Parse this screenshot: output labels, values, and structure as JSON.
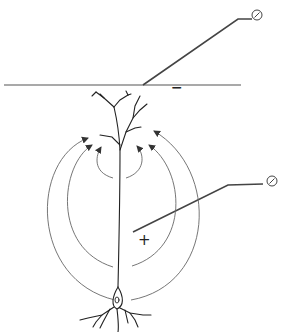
{
  "diagram": {
    "type": "neuron extracellular field diagram",
    "labels": {
      "surface_polarity": "−",
      "depth_polarity": "+"
    },
    "elements": {
      "surface_line": "cortical surface",
      "surface_electrode": "gauge-icon",
      "depth_electrode": "gauge-icon",
      "neuron": "pyramidal neuron",
      "field_loops_left": 3,
      "field_loops_right": 3
    },
    "colors": {
      "line": "#555555",
      "neuron": "#222222",
      "background": "#ffffff"
    }
  }
}
